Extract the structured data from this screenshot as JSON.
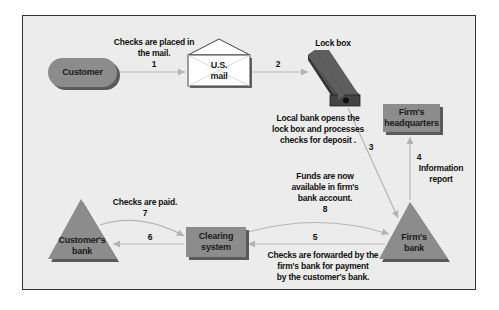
{
  "diagram": {
    "nodes": {
      "customer": "Customer",
      "us_mail_line1": "U.S.",
      "us_mail_line2": "mail",
      "lock_box": "Lock box",
      "firms_hq_line1": "Firm's",
      "firms_hq_line2": "headquarters",
      "firms_bank_line1": "Firm's",
      "firms_bank_line2": "bank",
      "clearing_line1": "Clearing",
      "clearing_line2": "system",
      "customers_bank_line1": "Customer's",
      "customers_bank_line2": "bank"
    },
    "steps": {
      "s1_text_line1": "Checks are placed in",
      "s1_text_line2": "the mail.",
      "s1_num": "1",
      "s2_num": "2",
      "s3_text_line1": "Local bank opens the",
      "s3_text_line2": "lock box and processes",
      "s3_text_line3": "checks for deposit .",
      "s3_num": "3",
      "s4_num": "4",
      "s4_text_line1": "Information",
      "s4_text_line2": "report",
      "s5_num": "5",
      "s5_text_line1": "Checks are forwarded by the",
      "s5_text_line2": "firm's bank for payment",
      "s5_text_line3": "by the customer's bank.",
      "s6_num": "6",
      "s7_text": "Checks are paid.",
      "s7_num": "7",
      "s8_text_line1": "Funds are now",
      "s8_text_line2": "available in firm's",
      "s8_text_line3": "bank account.",
      "s8_num": "8"
    },
    "colors": {
      "background": "#ececec",
      "node_fill": "#8c8c8c",
      "node_shadow": "#5a5a5a",
      "arrow": "#b4b4b4",
      "lockbox": "#5e5e5e"
    }
  }
}
